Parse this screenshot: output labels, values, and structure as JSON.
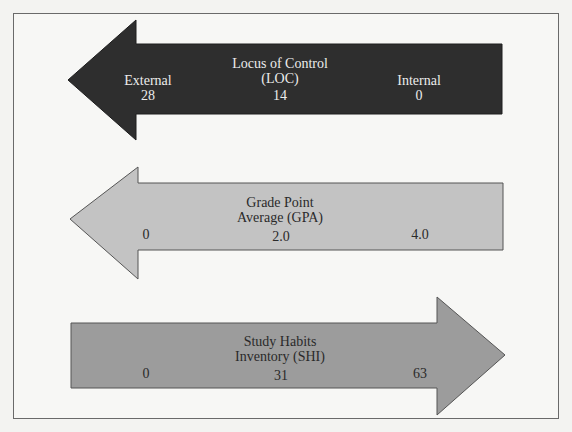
{
  "colors": {
    "loc_fill": "#2e2e2e",
    "gpa_fill": "#c3c3c3",
    "shi_fill": "#9c9c9c",
    "frame_border": "#6a6a6a",
    "background": "#f7f7f5"
  },
  "arrows": [
    {
      "id": "loc",
      "direction": "left",
      "title_line1": "Locus of Control",
      "title_line2": "(LOC)",
      "left_label": "External",
      "left_value": "28",
      "mid_value": "14",
      "right_label": "Internal",
      "right_value": "0"
    },
    {
      "id": "gpa",
      "direction": "left",
      "title_line1": "Grade Point",
      "title_line2": "Average (GPA)",
      "left_value": "0",
      "mid_value": "2.0",
      "right_value": "4.0"
    },
    {
      "id": "shi",
      "direction": "right",
      "title_line1": "Study Habits",
      "title_line2": "Inventory (SHI)",
      "left_value": "0",
      "mid_value": "31",
      "right_value": "63"
    }
  ]
}
